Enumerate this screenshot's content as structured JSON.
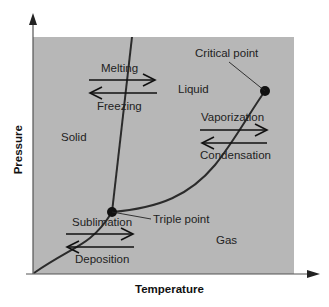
{
  "diagram": {
    "axes": {
      "x_label": "Temperature",
      "y_label": "Pressure"
    },
    "colors": {
      "plot_background": "#b7b7b7",
      "curve": "#2b2b2b",
      "text": "#222222"
    },
    "regions": {
      "solid": "Solid",
      "liquid": "Liquid",
      "gas": "Gas"
    },
    "points": {
      "critical": "Critical point",
      "triple": "Triple point"
    },
    "transitions": {
      "melting": "Melting",
      "freezing": "Freezing",
      "vaporization": "Vaporization",
      "condensation": "Condensation",
      "sublimation": "Sublimation",
      "deposition": "Deposition"
    }
  }
}
